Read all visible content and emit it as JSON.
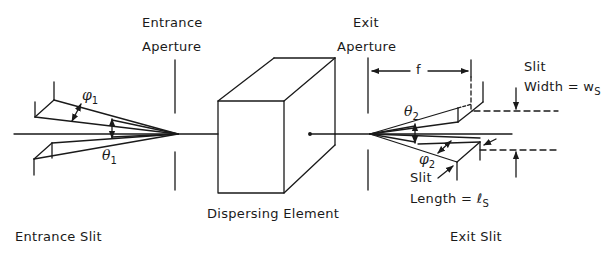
{
  "figure": {
    "type": "monochromator-schematic",
    "line_color": "#1a1a1a",
    "background": "#ffffff"
  },
  "labels": {
    "entrance_aperture": [
      "Entrance",
      "Aperture"
    ],
    "exit_aperture": [
      "Exit",
      "Aperture"
    ],
    "dispersing_element": "Dispersing Element",
    "entrance_slit": "Entrance Slit",
    "exit_slit": "Exit Slit",
    "focal_length": "f",
    "slit_width": [
      "Slit",
      "Width = w"
    ],
    "slit_width_sub": "S",
    "slit_length": [
      "Slit",
      "Length = ℓ"
    ],
    "slit_length_sub": "S"
  },
  "symbols": {
    "phi1": "φ",
    "phi1_sub": "1",
    "theta1": "θ",
    "theta1_sub": "1",
    "theta2": "θ",
    "theta2_sub": "2",
    "phi2": "φ",
    "phi2_sub": "2"
  }
}
